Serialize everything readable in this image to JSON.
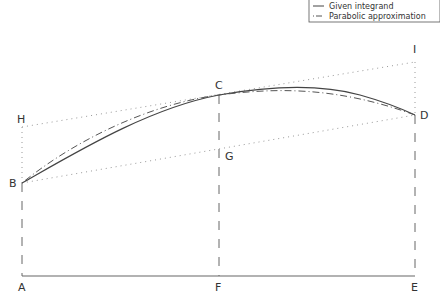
{
  "legend": {
    "items": [
      {
        "label": "Given integrand",
        "style": "solid"
      },
      {
        "label": "Parabolic approximation",
        "style": "dashdot"
      }
    ]
  },
  "points": {
    "A": {
      "label": "A",
      "x": 22,
      "y": 276
    },
    "B": {
      "label": "B",
      "x": 22,
      "y": 183
    },
    "C": {
      "label": "C",
      "x": 219,
      "y": 95
    },
    "D": {
      "label": "D",
      "x": 415,
      "y": 115
    },
    "E": {
      "label": "E",
      "x": 415,
      "y": 276
    },
    "F": {
      "label": "F",
      "x": 219,
      "y": 276
    },
    "G": {
      "label": "G",
      "x": 219,
      "y": 150
    },
    "H": {
      "label": "H",
      "x": 22,
      "y": 127
    },
    "I": {
      "label": "I",
      "x": 415,
      "y": 62
    }
  },
  "colors": {
    "curve": "#444444",
    "approx": "#555555",
    "dotted": "#999999",
    "axis": "#666666"
  }
}
